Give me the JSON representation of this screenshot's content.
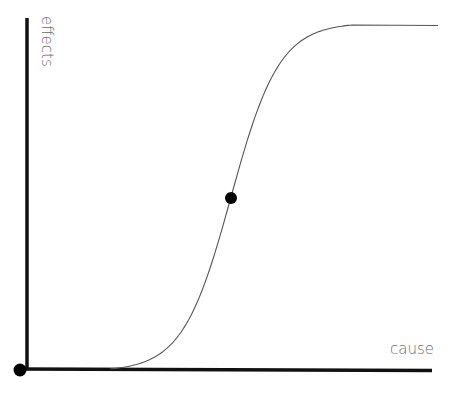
{
  "diagram": {
    "type": "sigmoid-curve",
    "x_axis_label": "cause",
    "y_axis_label": "effects",
    "colors": {
      "axis": "#111111",
      "curve": "#555555",
      "label": "#6b6b6b",
      "marker": "#000000"
    },
    "curve": {
      "shape": "S-curve (logistic)",
      "x_range": [
        0,
        1
      ],
      "y_range": [
        0,
        1
      ],
      "start": 0.2,
      "midpoint": 0.5,
      "plateau_from": 0.8
    },
    "markers": [
      {
        "name": "origin",
        "x": 0,
        "y": 0
      },
      {
        "name": "inflection-point",
        "x": 0.5,
        "y": 0.5
      }
    ]
  }
}
